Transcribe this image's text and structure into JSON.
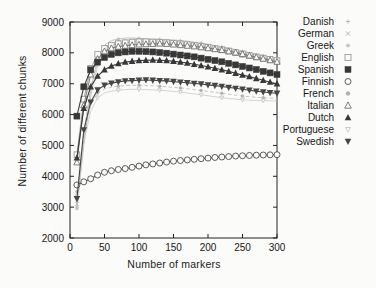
{
  "figure": {
    "background_color": "#fbfbf9",
    "axis_color": "#222222"
  },
  "chart_data": {
    "type": "line",
    "title": "",
    "xlabel": "Number of markers",
    "ylabel": "Number of different chunks",
    "xlim": [
      0,
      300
    ],
    "ylim": [
      2000,
      9000
    ],
    "xticks": [
      0,
      50,
      100,
      150,
      200,
      250,
      300
    ],
    "yticks": [
      2000,
      3000,
      4000,
      5000,
      6000,
      7000,
      8000,
      9000
    ],
    "grid": false,
    "legend_position": "right-outside",
    "x": [
      10,
      20,
      30,
      40,
      50,
      60,
      70,
      80,
      90,
      100,
      110,
      120,
      130,
      140,
      150,
      160,
      170,
      180,
      190,
      200,
      210,
      220,
      230,
      240,
      250,
      260,
      270,
      280,
      290,
      300
    ],
    "series": [
      {
        "name": "Danish",
        "marker": "plus",
        "line": "solid",
        "emphasis": "faint",
        "color": "#b4b4b4",
        "values": [
          3000,
          5200,
          6800,
          7800,
          8250,
          8400,
          8450,
          8480,
          8480,
          8470,
          8460,
          8450,
          8440,
          8430,
          8420,
          8400,
          8380,
          8350,
          8320,
          8280,
          8240,
          8200,
          8160,
          8110,
          8060,
          8010,
          7960,
          7910,
          7870,
          7830
        ]
      },
      {
        "name": "German",
        "marker": "cross",
        "line": "dashed",
        "emphasis": "faint",
        "color": "#aeaeae",
        "values": [
          3100,
          5400,
          6900,
          7750,
          8150,
          8300,
          8380,
          8420,
          8430,
          8430,
          8420,
          8410,
          8400,
          8380,
          8360,
          8340,
          8310,
          8280,
          8250,
          8210,
          8170,
          8130,
          8080,
          8030,
          7980,
          7930,
          7890,
          7840,
          7800,
          7760
        ]
      },
      {
        "name": "Greek",
        "marker": "asterisk",
        "line": "solid",
        "emphasis": "faint",
        "color": "#bcbcbc",
        "values": [
          2950,
          5000,
          6600,
          7600,
          8050,
          8250,
          8330,
          8370,
          8390,
          8390,
          8380,
          8370,
          8350,
          8330,
          8310,
          8280,
          8250,
          8220,
          8180,
          8140,
          8100,
          8050,
          8000,
          7950,
          7900,
          7850,
          7800,
          7760,
          7720,
          7690
        ]
      },
      {
        "name": "English",
        "marker": "square-open",
        "line": "solid",
        "emphasis": "normal",
        "color": "#9a9a9a",
        "values": [
          4700,
          6500,
          7500,
          7950,
          8150,
          8250,
          8300,
          8330,
          8350,
          8360,
          8360,
          8350,
          8340,
          8330,
          8310,
          8290,
          8270,
          8240,
          8210,
          8180,
          8140,
          8100,
          8060,
          8010,
          7960,
          7910,
          7870,
          7830,
          7790,
          7750
        ]
      },
      {
        "name": "Spanish",
        "marker": "square-filled",
        "line": "solid",
        "emphasis": "strong",
        "color": "#383838",
        "values": [
          5950,
          6900,
          7450,
          7700,
          7850,
          7950,
          8000,
          8030,
          8050,
          8050,
          8040,
          8030,
          8010,
          7990,
          7960,
          7930,
          7900,
          7870,
          7830,
          7790,
          7750,
          7710,
          7660,
          7610,
          7560,
          7510,
          7460,
          7400,
          7350,
          7300
        ]
      },
      {
        "name": "Finnish",
        "marker": "circle-open",
        "line": "solid",
        "emphasis": "strong",
        "color": "#4a4a4a",
        "values": [
          3720,
          3820,
          3920,
          4040,
          4130,
          4180,
          4220,
          4250,
          4290,
          4330,
          4370,
          4400,
          4430,
          4460,
          4490,
          4510,
          4530,
          4550,
          4570,
          4590,
          4610,
          4625,
          4640,
          4655,
          4665,
          4675,
          4685,
          4690,
          4695,
          4700
        ]
      },
      {
        "name": "French",
        "marker": "circle-filled",
        "line": "dashed",
        "emphasis": "faint",
        "color": "#b2b2b2",
        "values": [
          3500,
          5300,
          6300,
          6700,
          6830,
          6890,
          6920,
          6940,
          6950,
          6950,
          6940,
          6930,
          6920,
          6900,
          6880,
          6860,
          6840,
          6810,
          6780,
          6750,
          6720,
          6690,
          6660,
          6630,
          6600,
          6580,
          6560,
          6545,
          6535,
          6525
        ]
      },
      {
        "name": "Italian",
        "marker": "triangle-open",
        "line": "solid",
        "emphasis": "normal",
        "color": "#6e6e6e",
        "values": [
          4450,
          6300,
          7300,
          7800,
          8050,
          8150,
          8200,
          8230,
          8250,
          8270,
          8280,
          8290,
          8300,
          8290,
          8270,
          8250,
          8230,
          8210,
          8180,
          8150,
          8120,
          8090,
          8050,
          8010,
          7960,
          7910,
          7860,
          7810,
          7760,
          7710
        ]
      },
      {
        "name": "Dutch",
        "marker": "triangle-filled",
        "line": "solid",
        "emphasis": "strong",
        "color": "#383838",
        "values": [
          4600,
          6200,
          6900,
          7250,
          7450,
          7570,
          7650,
          7700,
          7730,
          7750,
          7760,
          7770,
          7760,
          7750,
          7730,
          7700,
          7670,
          7630,
          7590,
          7550,
          7500,
          7450,
          7400,
          7340,
          7280,
          7230,
          7170,
          7110,
          7050,
          7000
        ]
      },
      {
        "name": "Portuguese",
        "marker": "triangle-down-open",
        "line": "solid",
        "emphasis": "faint",
        "color": "#c6c6c6",
        "values": [
          3350,
          5100,
          6100,
          6550,
          6700,
          6760,
          6790,
          6810,
          6820,
          6820,
          6810,
          6800,
          6790,
          6770,
          6750,
          6730,
          6700,
          6670,
          6640,
          6610,
          6580,
          6550,
          6520,
          6500,
          6480,
          6465,
          6455,
          6450,
          6445,
          6440
        ]
      },
      {
        "name": "Swedish",
        "marker": "triangle-down-filled",
        "line": "solid",
        "emphasis": "strong",
        "color": "#464646",
        "values": [
          3270,
          5500,
          6400,
          6800,
          6950,
          7020,
          7060,
          7090,
          7100,
          7110,
          7120,
          7110,
          7100,
          7090,
          7070,
          7050,
          7030,
          7010,
          6990,
          6960,
          6940,
          6910,
          6880,
          6850,
          6820,
          6790,
          6760,
          6730,
          6710,
          6690
        ]
      }
    ]
  }
}
